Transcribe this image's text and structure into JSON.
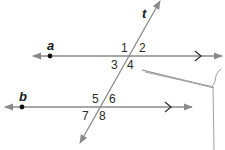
{
  "diagram": {
    "lines": {
      "a": {
        "label": "a"
      },
      "b": {
        "label": "b"
      },
      "t": {
        "label": "t"
      }
    },
    "angles": [
      "1",
      "2",
      "3",
      "4",
      "5",
      "6",
      "7",
      "8"
    ],
    "colors": {
      "line": "#8a8a8a",
      "text": "#1a1a1a",
      "point": "#111111",
      "callout": "#9a9a9a"
    }
  }
}
